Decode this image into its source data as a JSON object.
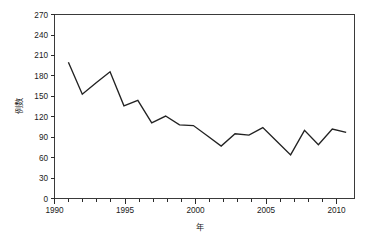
{
  "chart_data": {
    "type": "line",
    "title": "",
    "subtitle": "",
    "xlabel": "年",
    "ylabel": "例数",
    "x": [
      1990,
      1991,
      1992,
      1993,
      1994,
      1995,
      1996,
      1997,
      1998,
      1999,
      2000,
      2001,
      2002,
      2003,
      2004,
      2005,
      2006,
      2007,
      2008,
      2009,
      2010
    ],
    "values": [
      200,
      153,
      170,
      186,
      136,
      144,
      111,
      121,
      108,
      107,
      92,
      77,
      95,
      93,
      104,
      84,
      64,
      100,
      79,
      102,
      97
    ],
    "series": [
      {
        "name": "例数",
        "values": [
          200,
          153,
          170,
          186,
          136,
          144,
          111,
          121,
          108,
          107,
          92,
          77,
          95,
          93,
          104,
          84,
          64,
          100,
          79,
          102,
          97
        ]
      }
    ],
    "xlim": [
      1989,
      2010.6
    ],
    "ylim": [
      0,
      270
    ],
    "xticks": [
      1990,
      1995,
      2000,
      2005,
      2010
    ],
    "xtick_labels": [
      "1990",
      "1995",
      "2000",
      "2005",
      "2010"
    ],
    "yticks": [
      0,
      30,
      60,
      90,
      120,
      150,
      180,
      210,
      240,
      270
    ],
    "ytick_labels": [
      "0",
      "30",
      "60",
      "90",
      "120",
      "150",
      "180",
      "210",
      "240",
      "270"
    ],
    "minor_xticks_every": 1,
    "grid": false,
    "legend": null,
    "legend_position": "none",
    "annotations": [],
    "line_color": "#222222",
    "markers": false
  },
  "axes": {
    "y_axis_title": "例数",
    "x_axis_title": "年"
  }
}
